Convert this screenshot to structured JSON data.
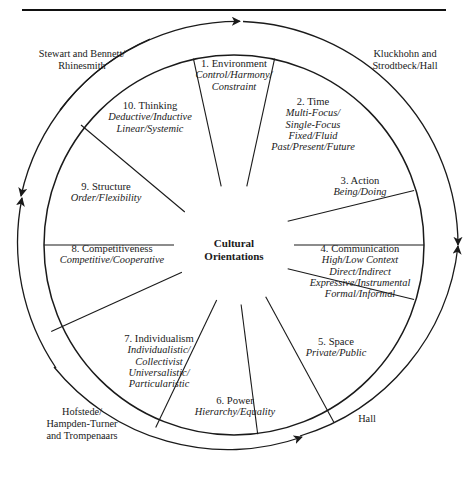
{
  "figure": {
    "center_title_line1": "Cultural",
    "center_title_line2": "Orientations"
  },
  "sectors": [
    {
      "id": "environment",
      "number": "1. Environment",
      "values": [
        "Control/Harmony/",
        "Constraint"
      ]
    },
    {
      "id": "time",
      "number": "2. Time",
      "values": [
        "Multi-Focus/",
        "Single-Focus",
        "Fixed/Fluid",
        "Past/Present/Future"
      ]
    },
    {
      "id": "action",
      "number": "3. Action",
      "values": [
        "Being/Doing"
      ]
    },
    {
      "id": "communication",
      "number": "4. Communication",
      "values": [
        "High/Low Context",
        "Direct/Indirect",
        "Expressive/Instrumental",
        "Formal/Informal"
      ]
    },
    {
      "id": "space",
      "number": "5. Space",
      "values": [
        "Private/Public"
      ]
    },
    {
      "id": "power",
      "number": "6. Power",
      "values": [
        "Hierarchy/Equality"
      ]
    },
    {
      "id": "individualism",
      "number": "7. Individualism",
      "values": [
        "Individualistic/",
        "Collectivist",
        "Universalistic/",
        "Particularistic"
      ]
    },
    {
      "id": "competitiveness",
      "number": "8. Competitiveness",
      "values": [
        "Competitive/Cooperative"
      ]
    },
    {
      "id": "structure",
      "number": "9. Structure",
      "values": [
        "Order/Flexibility"
      ]
    },
    {
      "id": "thinking",
      "number": "10. Thinking",
      "values": [
        "Deductive/Inductive",
        "Linear/Systemic"
      ]
    }
  ],
  "sources": [
    {
      "id": "stewart-bennett-rhinesmith",
      "lines": [
        "Stewart and Bennett/",
        "Rhinesmith"
      ]
    },
    {
      "id": "kluckhohn-strodtbeck-hall",
      "lines": [
        "Kluckhohn and",
        "Strodtbeck/Hall"
      ]
    },
    {
      "id": "hall",
      "lines": [
        "Hall"
      ]
    },
    {
      "id": "hofstede-hampden-trompenaars",
      "lines": [
        "Hofstede/",
        "Hampden-Turner",
        "and Trompenaars"
      ]
    }
  ],
  "colors": {
    "ink": "#1a1a1a",
    "rule": "#111111",
    "background": "#ffffff"
  }
}
